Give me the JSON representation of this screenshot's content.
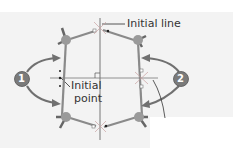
{
  "labels": {
    "initial_line": "Initial line",
    "initial_point_1": "Initial",
    "initial_point_2": "point"
  },
  "callouts": [
    {
      "number": "1"
    },
    {
      "number": "2"
    }
  ],
  "colors": {
    "background": "#f3f3f3",
    "line": "#555555",
    "arm": "#8a8a8a",
    "joint": "#9a9a9a",
    "callout": "#7a7a7a",
    "arrow": "#707070"
  }
}
